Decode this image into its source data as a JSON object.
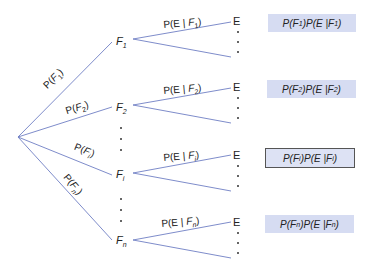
{
  "colors": {
    "line": "#6f7fc4",
    "box_fill": "#d6dcf2",
    "box_border": "#555555"
  },
  "branches": [
    {
      "label": "P(F1)",
      "node": "F",
      "sub": "1",
      "cond_label": "P(E | F1)",
      "leaf": "E",
      "product": "P(F1)P(E | F1)",
      "highlighted": false
    },
    {
      "label": "P(F2)",
      "node": "F",
      "sub": "2",
      "cond_label": "P(E | F2)",
      "leaf": "E",
      "product": "P(F2)P(E | F2)",
      "highlighted": false
    },
    {
      "label": "P(Fi)",
      "node": "F",
      "sub": "i",
      "cond_label": "P(E | Fi)",
      "leaf": "E",
      "product": "P(Fi)P(E | Fi)",
      "highlighted": true
    },
    {
      "label": "P(Fn)",
      "node": "F",
      "sub": "n",
      "cond_label": "P(E | Fn)",
      "leaf": "E",
      "product": "P(Fn)P(E | Fn)",
      "highlighted": false
    }
  ]
}
